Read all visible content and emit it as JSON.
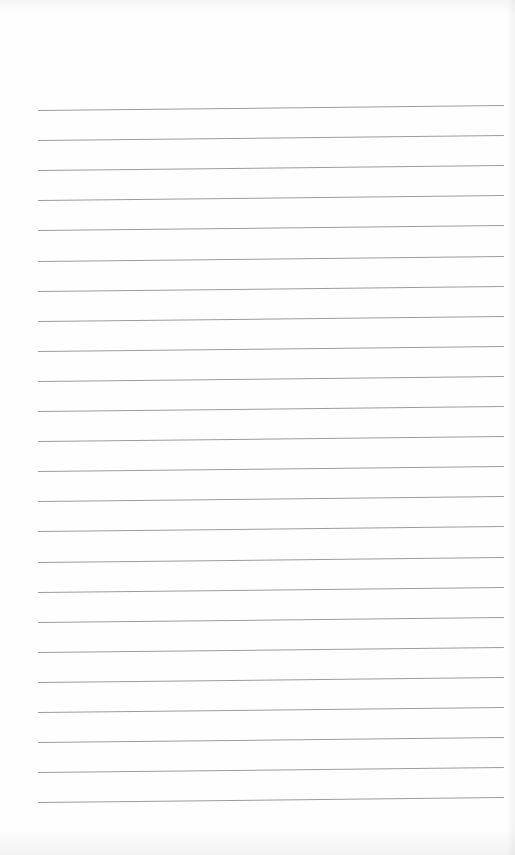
{
  "page": {
    "type": "blank lined notebook page",
    "line_count": 24,
    "line_color": "#9c9c9c",
    "background_color": "#fefefe",
    "first_line_y": 110,
    "line_spacing": 30.1,
    "line_left_x": 38,
    "line_right_x": 504,
    "line_tilt_px": -5
  }
}
